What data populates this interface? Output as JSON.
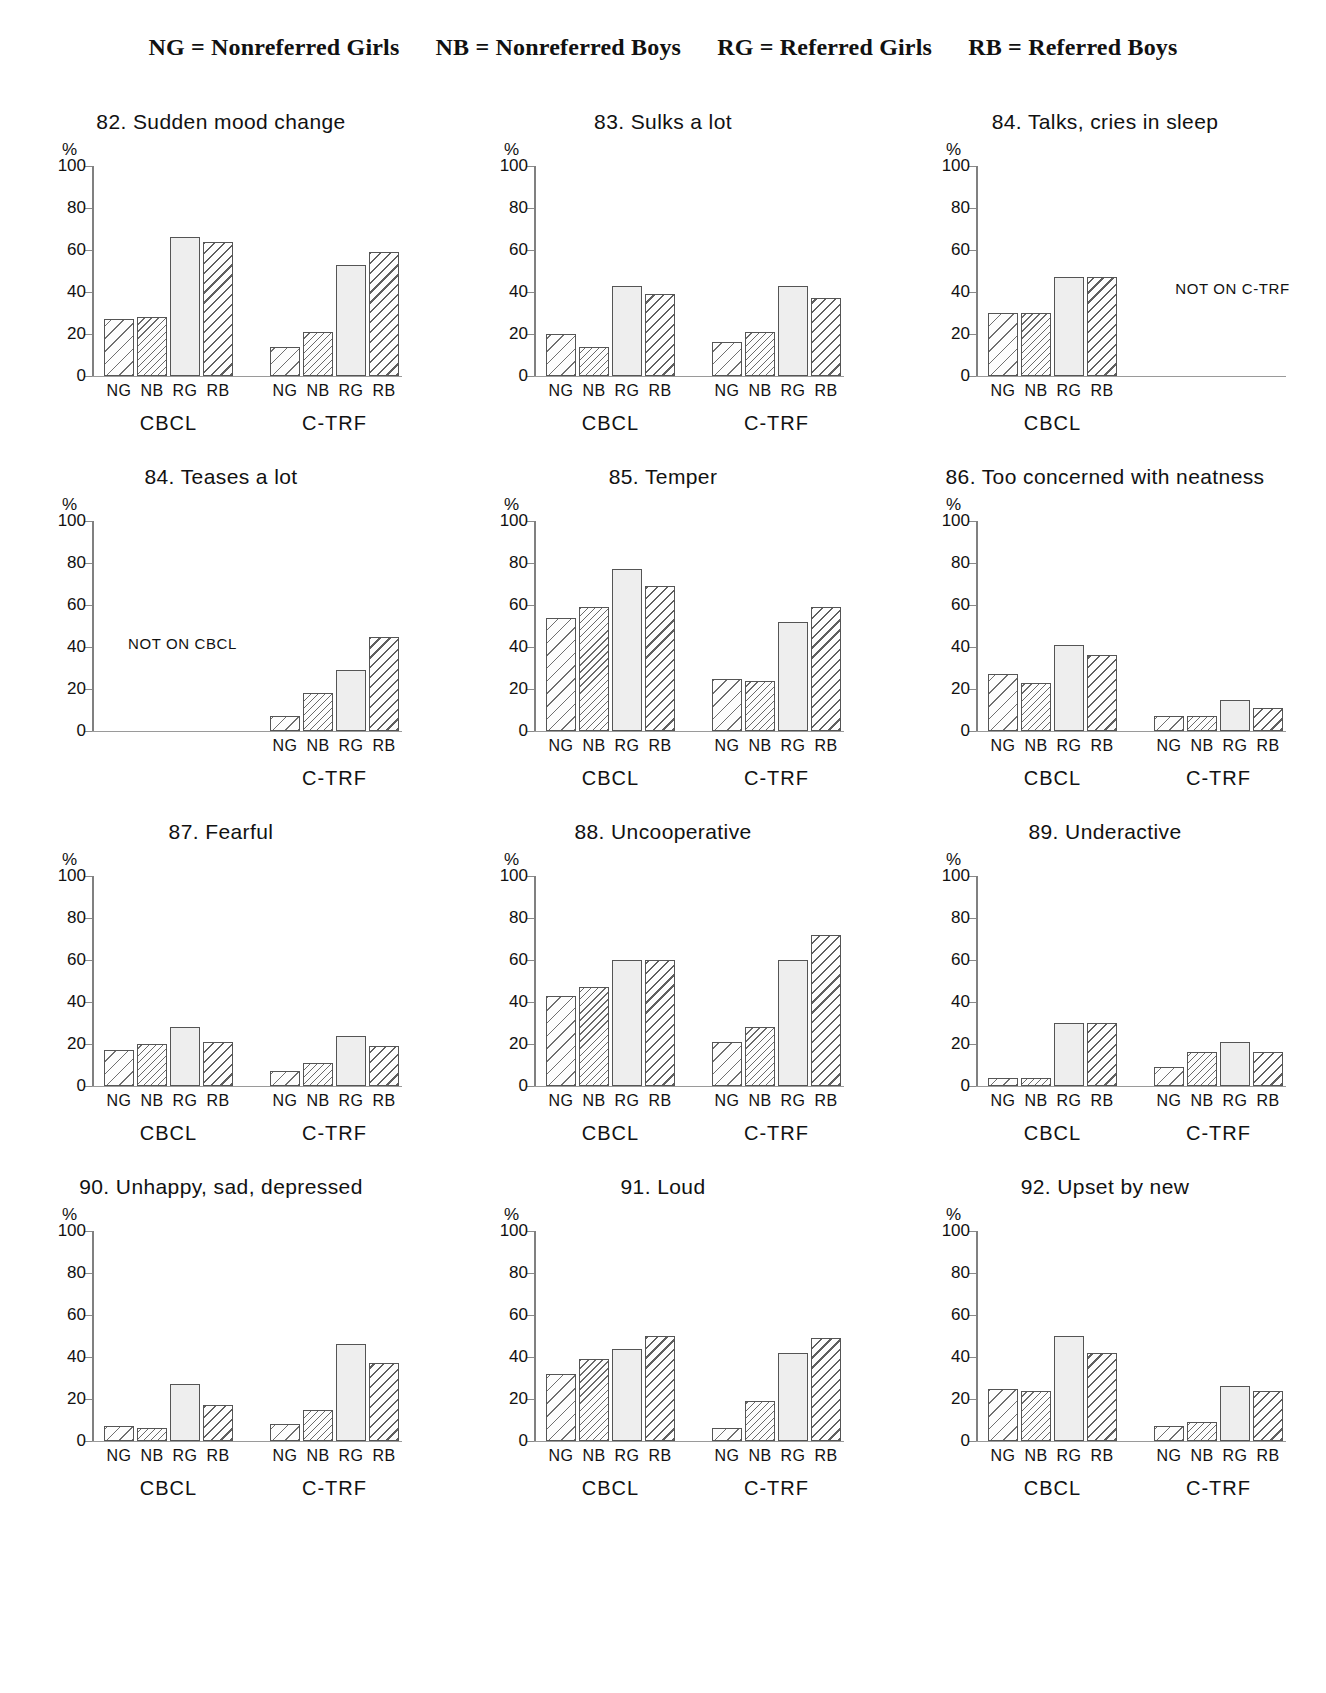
{
  "legend": {
    "entries": [
      "NG  =  Nonreferred Girls",
      "NB  =  Nonreferred Boys",
      "RG  =  Referred Girls",
      "RB  =  Referred Boys"
    ]
  },
  "axis": {
    "y_unit": "%",
    "y_ticks": [
      "0",
      "20",
      "40",
      "60",
      "80",
      "100"
    ],
    "categories": [
      "NG",
      "NB",
      "RG",
      "RB"
    ],
    "groups": [
      "CBCL",
      "C-TRF"
    ]
  },
  "chart_data": [
    {
      "type": "bar",
      "title": "82. Sudden mood change",
      "ylabel": "%",
      "ylim": [
        0,
        100
      ],
      "categories": [
        "NG",
        "NB",
        "RG",
        "RB"
      ],
      "groups": [
        "CBCL",
        "C-TRF"
      ],
      "series": [
        {
          "name": "CBCL",
          "values": [
            27,
            28,
            66,
            64
          ]
        },
        {
          "name": "C-TRF",
          "values": [
            14,
            21,
            53,
            59
          ]
        }
      ],
      "note": null
    },
    {
      "type": "bar",
      "title": "83. Sulks a lot",
      "ylabel": "%",
      "ylim": [
        0,
        100
      ],
      "categories": [
        "NG",
        "NB",
        "RG",
        "RB"
      ],
      "groups": [
        "CBCL",
        "C-TRF"
      ],
      "series": [
        {
          "name": "CBCL",
          "values": [
            20,
            14,
            43,
            39
          ]
        },
        {
          "name": "C-TRF",
          "values": [
            16,
            21,
            43,
            37
          ]
        }
      ],
      "note": null
    },
    {
      "type": "bar",
      "title": "84. Talks, cries in sleep",
      "ylabel": "%",
      "ylim": [
        0,
        100
      ],
      "categories": [
        "NG",
        "NB",
        "RG",
        "RB"
      ],
      "groups": [
        "CBCL"
      ],
      "series": [
        {
          "name": "CBCL",
          "values": [
            30,
            30,
            47,
            47
          ]
        },
        {
          "name": "C-TRF",
          "values": null
        }
      ],
      "note": "NOT ON C-TRF"
    },
    {
      "type": "bar",
      "title": "84. Teases a lot",
      "ylabel": "%",
      "ylim": [
        0,
        100
      ],
      "categories": [
        "NG",
        "NB",
        "RG",
        "RB"
      ],
      "groups": [
        "C-TRF"
      ],
      "series": [
        {
          "name": "CBCL",
          "values": null
        },
        {
          "name": "C-TRF",
          "values": [
            7,
            18,
            29,
            45
          ]
        }
      ],
      "note": "NOT ON CBCL"
    },
    {
      "type": "bar",
      "title": "85. Temper",
      "ylabel": "%",
      "ylim": [
        0,
        100
      ],
      "categories": [
        "NG",
        "NB",
        "RG",
        "RB"
      ],
      "groups": [
        "CBCL",
        "C-TRF"
      ],
      "series": [
        {
          "name": "CBCL",
          "values": [
            54,
            59,
            77,
            69
          ]
        },
        {
          "name": "C-TRF",
          "values": [
            25,
            24,
            52,
            59
          ]
        }
      ],
      "note": null
    },
    {
      "type": "bar",
      "title": "86. Too concerned with neatness",
      "ylabel": "%",
      "ylim": [
        0,
        100
      ],
      "categories": [
        "NG",
        "NB",
        "RG",
        "RB"
      ],
      "groups": [
        "CBCL",
        "C-TRF"
      ],
      "series": [
        {
          "name": "CBCL",
          "values": [
            27,
            23,
            41,
            36
          ]
        },
        {
          "name": "C-TRF",
          "values": [
            7,
            7,
            15,
            11
          ]
        }
      ],
      "note": null
    },
    {
      "type": "bar",
      "title": "87. Fearful",
      "ylabel": "%",
      "ylim": [
        0,
        100
      ],
      "categories": [
        "NG",
        "NB",
        "RG",
        "RB"
      ],
      "groups": [
        "CBCL",
        "C-TRF"
      ],
      "series": [
        {
          "name": "CBCL",
          "values": [
            17,
            20,
            28,
            21
          ]
        },
        {
          "name": "C-TRF",
          "values": [
            7,
            11,
            24,
            19
          ]
        }
      ],
      "note": null
    },
    {
      "type": "bar",
      "title": "88. Uncooperative",
      "ylabel": "%",
      "ylim": [
        0,
        100
      ],
      "categories": [
        "NG",
        "NB",
        "RG",
        "RB"
      ],
      "groups": [
        "CBCL",
        "C-TRF"
      ],
      "series": [
        {
          "name": "CBCL",
          "values": [
            43,
            47,
            60,
            60
          ]
        },
        {
          "name": "C-TRF",
          "values": [
            21,
            28,
            60,
            72
          ]
        }
      ],
      "note": null
    },
    {
      "type": "bar",
      "title": "89. Underactive",
      "ylabel": "%",
      "ylim": [
        0,
        100
      ],
      "categories": [
        "NG",
        "NB",
        "RG",
        "RB"
      ],
      "groups": [
        "CBCL",
        "C-TRF"
      ],
      "series": [
        {
          "name": "CBCL",
          "values": [
            4,
            4,
            30,
            30
          ]
        },
        {
          "name": "C-TRF",
          "values": [
            9,
            16,
            21,
            16
          ]
        }
      ],
      "note": null
    },
    {
      "type": "bar",
      "title": "90. Unhappy, sad, depressed",
      "ylabel": "%",
      "ylim": [
        0,
        100
      ],
      "categories": [
        "NG",
        "NB",
        "RG",
        "RB"
      ],
      "groups": [
        "CBCL",
        "C-TRF"
      ],
      "series": [
        {
          "name": "CBCL",
          "values": [
            7,
            6,
            27,
            17
          ]
        },
        {
          "name": "C-TRF",
          "values": [
            8,
            15,
            46,
            37
          ]
        }
      ],
      "note": null
    },
    {
      "type": "bar",
      "title": "91. Loud",
      "ylabel": "%",
      "ylim": [
        0,
        100
      ],
      "categories": [
        "NG",
        "NB",
        "RG",
        "RB"
      ],
      "groups": [
        "CBCL",
        "C-TRF"
      ],
      "series": [
        {
          "name": "CBCL",
          "values": [
            32,
            39,
            44,
            50
          ]
        },
        {
          "name": "C-TRF",
          "values": [
            6,
            19,
            42,
            49
          ]
        }
      ],
      "note": null
    },
    {
      "type": "bar",
      "title": "92. Upset by new",
      "ylabel": "%",
      "ylim": [
        0,
        100
      ],
      "categories": [
        "NG",
        "NB",
        "RG",
        "RB"
      ],
      "groups": [
        "CBCL",
        "C-TRF"
      ],
      "series": [
        {
          "name": "CBCL",
          "values": [
            25,
            24,
            50,
            42
          ]
        },
        {
          "name": "C-TRF",
          "values": [
            7,
            9,
            26,
            24
          ]
        }
      ],
      "note": null
    }
  ]
}
